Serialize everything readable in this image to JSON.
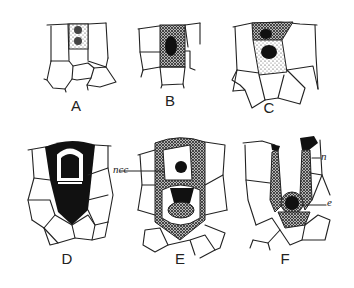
{
  "figure": {
    "panels": [
      {
        "id": "A",
        "label": "A"
      },
      {
        "id": "B",
        "label": "B"
      },
      {
        "id": "C",
        "label": "C"
      },
      {
        "id": "D",
        "label": "D"
      },
      {
        "id": "E",
        "label": "E"
      },
      {
        "id": "F",
        "label": "F"
      }
    ],
    "annotations": {
      "ncc": "ncc",
      "n": "n",
      "e": "e"
    }
  }
}
